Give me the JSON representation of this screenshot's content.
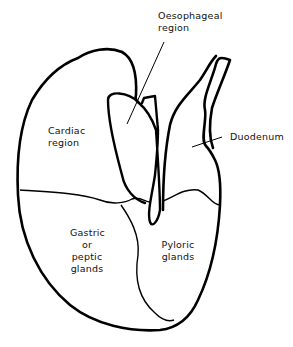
{
  "diagram": {
    "type": "anatomical-line-drawing",
    "labels": {
      "oesophageal_line1": "Oesophageal",
      "oesophageal_line2": "region",
      "cardiac_line1": "Cardiac",
      "cardiac_line2": "region",
      "duodenum": "Duodenum",
      "gastric_line1": "Gastric",
      "gastric_line2": "or",
      "gastric_line3": "peptic",
      "gastric_line4": "glands",
      "pyloric_line1": "Pyloric",
      "pyloric_line2": "glands"
    },
    "colors": {
      "stroke": "#000000",
      "background": "#ffffff",
      "text": "#111111"
    }
  }
}
